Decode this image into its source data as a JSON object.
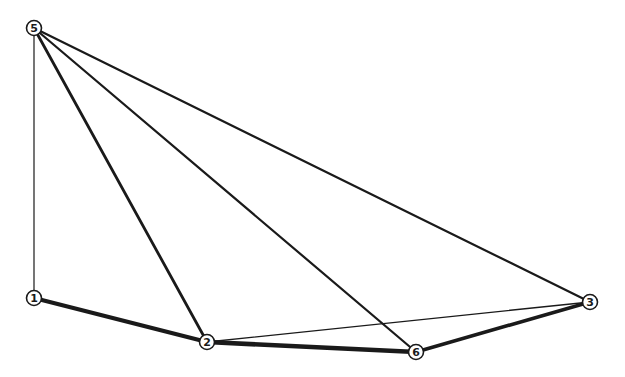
{
  "diagram": {
    "type": "weighted-graph",
    "colors": {
      "ink": "#1a1a1a",
      "background": "#ffffff"
    },
    "nodes": [
      {
        "id": "5",
        "label": "5",
        "x": 34,
        "y": 28
      },
      {
        "id": "1",
        "label": "1",
        "x": 34,
        "y": 298
      },
      {
        "id": "2",
        "label": "2",
        "x": 207,
        "y": 342
      },
      {
        "id": "6",
        "label": "6",
        "x": 416,
        "y": 352
      },
      {
        "id": "3",
        "label": "3",
        "x": 590,
        "y": 302
      }
    ],
    "edges": [
      {
        "from": "5",
        "to": "1",
        "weight": "thin",
        "width": 1.2
      },
      {
        "from": "5",
        "to": "2",
        "weight": "medium-thick",
        "width": 2.8
      },
      {
        "from": "5",
        "to": "6",
        "weight": "medium",
        "width": 2.2
      },
      {
        "from": "5",
        "to": "3",
        "weight": "medium",
        "width": 2.2
      },
      {
        "from": "1",
        "to": "2",
        "weight": "thick",
        "width": 4.2
      },
      {
        "from": "2",
        "to": "6",
        "weight": "thick",
        "width": 4.6
      },
      {
        "from": "6",
        "to": "3",
        "weight": "thick",
        "width": 3.6
      },
      {
        "from": "2",
        "to": "3",
        "weight": "thin",
        "width": 1.4
      }
    ]
  }
}
